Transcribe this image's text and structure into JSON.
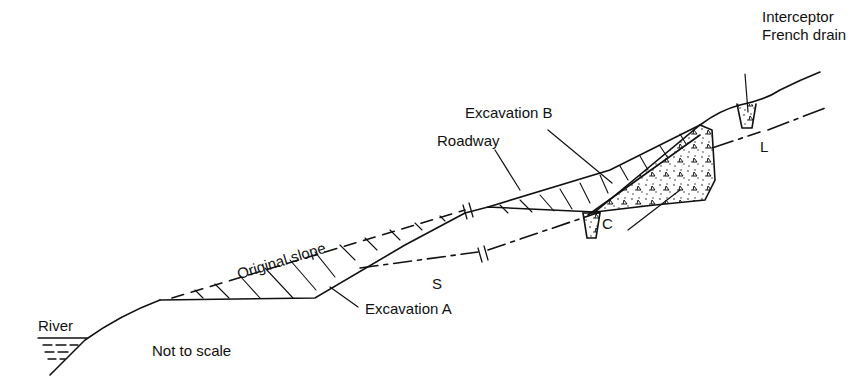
{
  "diagram": {
    "type": "slope cross-section",
    "labels": {
      "interceptor": "Interceptor",
      "french_drain": "French drain",
      "excavation_b": "Excavation B",
      "roadway": "Roadway",
      "l": "L",
      "c": "C",
      "original_slope": "Original slope",
      "s": "S",
      "excavation_a": "Excavation A",
      "river": "River",
      "not_to_scale": "Not to scale"
    },
    "colors": {
      "ink": "#111111",
      "background": "#ffffff"
    }
  }
}
